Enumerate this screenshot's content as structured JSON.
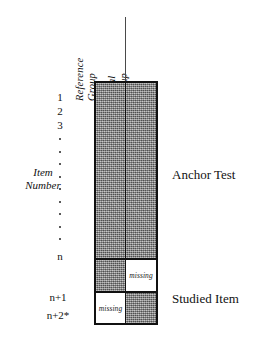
{
  "figure": {
    "columns": [
      {
        "id": "reference",
        "line1": "Reference",
        "line2": "Group"
      },
      {
        "id": "focal",
        "line1": "Focal",
        "line2": "Group"
      }
    ],
    "axis": {
      "label_line1": "Item",
      "label_line2": "Number",
      "ticks": [
        "1",
        "2",
        "3"
      ],
      "ellipsis_dot_count": 9,
      "tick_n": "n",
      "tick_n_plus_1": "n+1",
      "tick_n_plus_2": "n+2*"
    },
    "sections": [
      {
        "id": "anchor",
        "caption": "Anchor Test"
      },
      {
        "id": "studied",
        "caption": "Studied Item"
      }
    ],
    "rows": [
      {
        "id": "anchor-block",
        "label": "",
        "cells": [
          {
            "column": "reference",
            "state": "shaded",
            "label": ""
          },
          {
            "column": "focal",
            "state": "shaded",
            "label": ""
          }
        ]
      },
      {
        "id": "row-n-plus-1",
        "label": "n+1",
        "cells": [
          {
            "column": "reference",
            "state": "shaded",
            "label": ""
          },
          {
            "column": "focal",
            "state": "missing",
            "label": "missing"
          }
        ]
      },
      {
        "id": "row-n-plus-2",
        "label": "n+2*",
        "cells": [
          {
            "column": "reference",
            "state": "missing",
            "label": "missing"
          },
          {
            "column": "focal",
            "state": "shaded",
            "label": ""
          }
        ]
      }
    ],
    "colors": {
      "shaded_fill": "#8d8d8d",
      "blank_fill": "#ffffff",
      "border": "#111111",
      "text": "#111111"
    }
  }
}
